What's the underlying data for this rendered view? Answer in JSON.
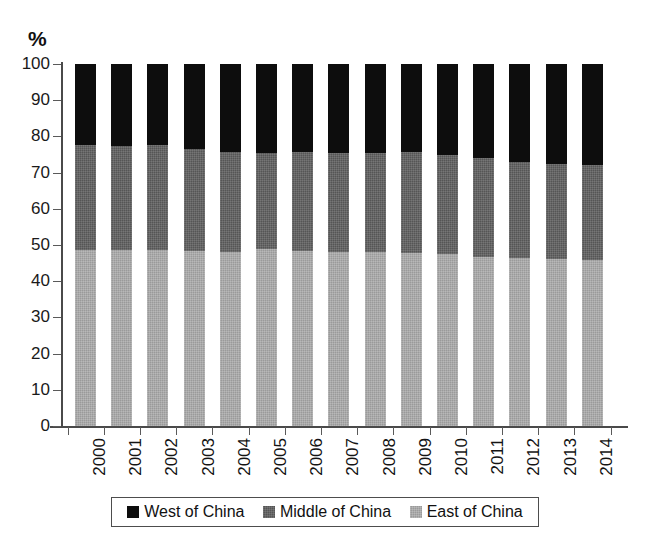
{
  "chart_data": {
    "type": "bar",
    "stacked": true,
    "title": "",
    "subtitle": "",
    "xlabel": "",
    "ylabel": "%",
    "unit_label": "%",
    "ylim": [
      0,
      100
    ],
    "y_ticks": [
      0,
      10,
      20,
      30,
      40,
      50,
      60,
      70,
      80,
      90,
      100
    ],
    "grid": false,
    "legend_position": "bottom",
    "categories": [
      "2000",
      "2001",
      "2002",
      "2003",
      "2004",
      "2005",
      "2006",
      "2007",
      "2008",
      "2009",
      "2010",
      "2011",
      "2012",
      "2013",
      "2014"
    ],
    "series": [
      {
        "name": "East of China",
        "color": "#9a9a9a",
        "values": [
          48.7,
          48.6,
          48.5,
          48.4,
          48.2,
          48.8,
          48.4,
          48.2,
          48.0,
          47.8,
          47.4,
          46.8,
          46.3,
          46.2,
          45.8
        ]
      },
      {
        "name": "Middle of China",
        "color": "#555555",
        "values": [
          29.0,
          28.8,
          29.1,
          28.0,
          27.6,
          26.6,
          27.2,
          27.2,
          27.4,
          27.9,
          27.5,
          27.2,
          26.6,
          26.2,
          26.2
        ]
      },
      {
        "name": "West of China",
        "color": "#0d0d0d",
        "values": [
          22.3,
          22.6,
          22.4,
          23.6,
          24.2,
          24.6,
          24.4,
          24.6,
          24.6,
          24.3,
          25.1,
          26.0,
          27.1,
          27.6,
          28.0
        ]
      }
    ],
    "cumulative_tops": {
      "east": [
        48.7,
        48.6,
        48.5,
        48.4,
        48.2,
        48.8,
        48.4,
        48.2,
        48.0,
        47.8,
        47.4,
        46.8,
        46.3,
        46.2,
        45.8
      ],
      "middle": [
        77.7,
        77.4,
        77.6,
        76.4,
        75.8,
        75.4,
        75.6,
        75.4,
        75.4,
        75.7,
        74.9,
        74.0,
        72.9,
        72.4,
        72.0
      ],
      "west": [
        100,
        100,
        100,
        100,
        100,
        100,
        100,
        100,
        100,
        100,
        100,
        100,
        100,
        100,
        100
      ]
    }
  },
  "legend": {
    "items": [
      {
        "label": "West of China",
        "color": "#0d0d0d"
      },
      {
        "label": "Middle of China",
        "color": "#555555"
      },
      {
        "label": "East of China",
        "color": "#9a9a9a"
      }
    ]
  }
}
